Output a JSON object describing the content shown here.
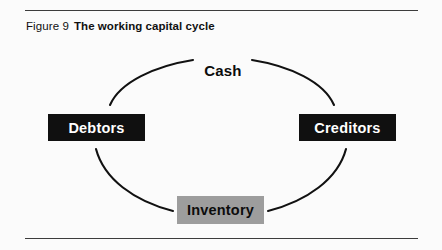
{
  "figure": {
    "number_label": "Figure 9",
    "title": "The working capital cycle"
  },
  "diagram": {
    "type": "cycle-diagram",
    "shape": "ellipse",
    "nodes": [
      {
        "id": "cash",
        "label": "Cash",
        "style": "plain",
        "position": "top",
        "text_color": "#0c0c0c",
        "fill_color": "transparent"
      },
      {
        "id": "debtors",
        "label": "Debtors",
        "style": "dark",
        "position": "left",
        "text_color": "#ffffff",
        "fill_color": "#101010"
      },
      {
        "id": "creditors",
        "label": "Creditors",
        "style": "dark",
        "position": "right",
        "text_color": "#ffffff",
        "fill_color": "#101010"
      },
      {
        "id": "inventory",
        "label": "Inventory",
        "style": "gray",
        "position": "bottom",
        "text_color": "#0c0c0c",
        "fill_color": "#9d9d9d"
      }
    ],
    "line_color": "#111111"
  },
  "rules": {
    "color": "#3c3c3c"
  }
}
